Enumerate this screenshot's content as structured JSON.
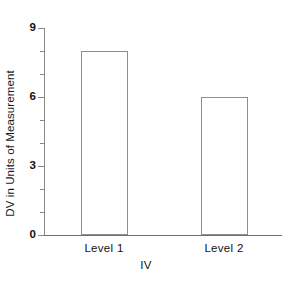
{
  "chart_data": {
    "type": "bar",
    "title": "",
    "categories": [
      "Level 1",
      "Level 2"
    ],
    "values": [
      8,
      6
    ],
    "series": [
      {
        "name": "DV",
        "values": [
          8,
          6
        ]
      }
    ],
    "xlabel": "IV",
    "ylabel": "DV in Units of Measurement",
    "ylim": [
      0,
      9
    ],
    "xlim": [
      0,
      2
    ],
    "y_major_ticks": [
      0,
      3,
      6,
      9
    ],
    "y_minor_ticks": [
      1,
      2,
      4,
      5,
      7,
      8
    ],
    "y_tick_labels": [
      "0",
      "3",
      "6",
      "9"
    ],
    "grid": false,
    "legend": false,
    "bar_fill": "#ffffff",
    "bar_outline": "#8f8f8f",
    "axis_color": "#8a8a8a",
    "text_color": "#111111"
  },
  "axes": {
    "y_title": "DV in Units of Measurement",
    "x_title": "IV",
    "y_labels": [
      {
        "text": "9",
        "value": 9
      },
      {
        "text": "6",
        "value": 6
      },
      {
        "text": "3",
        "value": 3
      },
      {
        "text": "0",
        "value": 0
      }
    ]
  },
  "bars": [
    {
      "label": "Level 1",
      "value": 8
    },
    {
      "label": "Level 2",
      "value": 6
    }
  ]
}
